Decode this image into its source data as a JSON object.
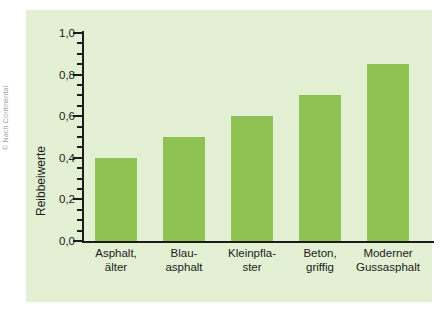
{
  "credit": "© Nach Continental",
  "chart_data": {
    "type": "bar",
    "title": "",
    "xlabel": "",
    "ylabel": "Reibbeiwerte",
    "ylim": [
      0.0,
      1.0
    ],
    "grid": false,
    "legend": "none",
    "bar_color": "#8ec252",
    "panel_color": "#e3f0d4",
    "axis_color": "#1b1b1b",
    "categories": [
      "Asphalt,\nälter",
      "Blau-\nasphalt",
      "Kleinpfla-\nster",
      "Beton,\ngriffig",
      "Moderner\nGussasphalt"
    ],
    "values": [
      0.4,
      0.5,
      0.6,
      0.7,
      0.85
    ],
    "y_major_ticks": [
      "0,0",
      "0,2",
      "0,4",
      "0,6",
      "0,8",
      "1,0"
    ],
    "y_major_values": [
      0.0,
      0.2,
      0.4,
      0.6,
      0.8,
      1.0
    ],
    "y_minor_step": 0.05
  }
}
